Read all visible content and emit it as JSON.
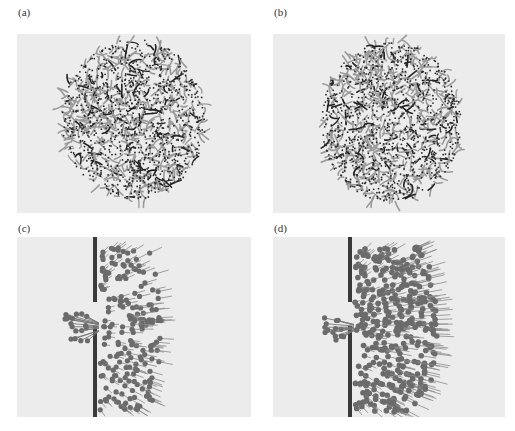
{
  "figure": {
    "panels": [
      {
        "id": "a",
        "label": "(a)",
        "description": "dense tangled circular cluster of filaments with dotted beads"
      },
      {
        "id": "b",
        "label": "(b)",
        "description": "dense tangled irregular cluster of filaments with dotted beads"
      },
      {
        "id": "c",
        "label": "(c)",
        "description": "array of bead-headed filaments next to a vertical wall with a gap; some pass through the gap to the left"
      },
      {
        "id": "d",
        "label": "(d)",
        "description": "dense packed bead-headed filaments against a vertical wall with a gap; some pass through to the left"
      }
    ],
    "colors": {
      "background": "#ececec",
      "wall": "#3a3a3a",
      "bead": "#6b6b6b",
      "filament": "#555555"
    }
  }
}
